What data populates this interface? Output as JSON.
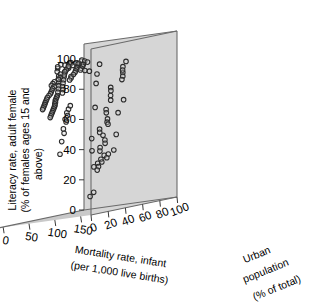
{
  "figure": {
    "type": "3d-scatter",
    "panel_color": "#d6d6d6",
    "floor_color": "#c9c9c9",
    "edge_color": "#6b6b6b",
    "point_stroke": "#2b2b2b",
    "point_fill": "#d6d6d6",
    "text_color": "#000000"
  },
  "axes": {
    "y": {
      "label_line1": "Literacy rate, adult female",
      "label_line2": "(% of females ages 15 and",
      "label_line3": "above)",
      "ticks": [
        "0",
        "20",
        "40",
        "60",
        "80",
        "100"
      ],
      "range": [
        0,
        110
      ]
    },
    "x": {
      "label_line1": "Mortality rate, infant",
      "label_line2": "(per 1,000 live births)",
      "ticks": [
        "0",
        "50",
        "100",
        "150"
      ],
      "range": [
        -10,
        170
      ]
    },
    "z": {
      "label_line1": "Urban",
      "label_line2": "population",
      "label_line3": "(% of total)",
      "ticks": [
        "100",
        "80",
        "60",
        "40",
        "20",
        "0"
      ],
      "range": [
        0,
        100
      ]
    }
  },
  "chart_data": {
    "type": "scatter",
    "title": "",
    "xlabel": "Mortality rate, infant (per 1,000 live births)",
    "ylabel": "Literacy rate, adult female (% of females ages 15 and above)",
    "zlabel": "Urban population (% of total)",
    "xlim": [
      -10,
      170
    ],
    "ylim": [
      0,
      110
    ],
    "zlim": [
      0,
      100
    ],
    "grid": false,
    "legend": "none",
    "n_points": 138,
    "points": [
      [
        6,
        99,
        73
      ],
      [
        8,
        99,
        67
      ],
      [
        10,
        100,
        61
      ],
      [
        12,
        100,
        70
      ],
      [
        5,
        99,
        75
      ],
      [
        14,
        98,
        55
      ],
      [
        9,
        99,
        58
      ],
      [
        16,
        97,
        66
      ],
      [
        11,
        100,
        72
      ],
      [
        18,
        96,
        52
      ],
      [
        20,
        95,
        60
      ],
      [
        22,
        97,
        63
      ],
      [
        13,
        98,
        68
      ],
      [
        24,
        94,
        57
      ],
      [
        26,
        93,
        49
      ],
      [
        15,
        99,
        77
      ],
      [
        28,
        92,
        54
      ],
      [
        30,
        91,
        46
      ],
      [
        17,
        98,
        71
      ],
      [
        32,
        90,
        51
      ],
      [
        19,
        96,
        62
      ],
      [
        34,
        89,
        44
      ],
      [
        21,
        95,
        59
      ],
      [
        36,
        88,
        48
      ],
      [
        23,
        94,
        53
      ],
      [
        38,
        87,
        42
      ],
      [
        25,
        93,
        56
      ],
      [
        40,
        86,
        45
      ],
      [
        27,
        92,
        50
      ],
      [
        42,
        85,
        39
      ],
      [
        29,
        91,
        47
      ],
      [
        44,
        84,
        43
      ],
      [
        31,
        90,
        41
      ],
      [
        46,
        83,
        36
      ],
      [
        33,
        89,
        38
      ],
      [
        48,
        82,
        40
      ],
      [
        35,
        88,
        35
      ],
      [
        50,
        81,
        33
      ],
      [
        37,
        87,
        37
      ],
      [
        52,
        80,
        31
      ],
      [
        39,
        86,
        34
      ],
      [
        54,
        79,
        29
      ],
      [
        41,
        85,
        32
      ],
      [
        56,
        78,
        27
      ],
      [
        43,
        84,
        30
      ],
      [
        58,
        77,
        26
      ],
      [
        45,
        83,
        28
      ],
      [
        60,
        76,
        24
      ],
      [
        47,
        82,
        25
      ],
      [
        62,
        75,
        23
      ],
      [
        49,
        81,
        22
      ],
      [
        64,
        74,
        21
      ],
      [
        51,
        80,
        20
      ],
      [
        66,
        73,
        19
      ],
      [
        53,
        79,
        18
      ],
      [
        68,
        72,
        17
      ],
      [
        55,
        78,
        16
      ],
      [
        70,
        71,
        15
      ],
      [
        57,
        77,
        14
      ],
      [
        72,
        70,
        13
      ],
      [
        59,
        76,
        12
      ],
      [
        74,
        69,
        11
      ],
      [
        61,
        75,
        10
      ],
      [
        76,
        68,
        9
      ],
      [
        63,
        74,
        8
      ],
      [
        7,
        99,
        80
      ],
      [
        9,
        98,
        82
      ],
      [
        11,
        97,
        85
      ],
      [
        6,
        100,
        88
      ],
      [
        13,
        96,
        78
      ],
      [
        8,
        99,
        90
      ],
      [
        15,
        95,
        76
      ],
      [
        10,
        98,
        92
      ],
      [
        17,
        94,
        74
      ],
      [
        12,
        97,
        86
      ],
      [
        19,
        93,
        72
      ],
      [
        14,
        96,
        84
      ],
      [
        21,
        92,
        69
      ],
      [
        16,
        95,
        81
      ],
      [
        23,
        91,
        65
      ],
      [
        18,
        94,
        79
      ],
      [
        25,
        90,
        64
      ],
      [
        20,
        93,
        83
      ],
      [
        27,
        89,
        61
      ],
      [
        22,
        92,
        87
      ],
      [
        35,
        70,
        55
      ],
      [
        40,
        68,
        50
      ],
      [
        45,
        64,
        45
      ],
      [
        30,
        72,
        60
      ],
      [
        50,
        58,
        40
      ],
      [
        55,
        50,
        35
      ],
      [
        60,
        42,
        30
      ],
      [
        38,
        66,
        52
      ],
      [
        42,
        62,
        48
      ],
      [
        48,
        55,
        42
      ],
      [
        85,
        88,
        88
      ],
      [
        92,
        92,
        84
      ],
      [
        98,
        90,
        80
      ],
      [
        105,
        86,
        76
      ],
      [
        110,
        84,
        72
      ],
      [
        88,
        95,
        90
      ],
      [
        95,
        80,
        68
      ],
      [
        102,
        78,
        64
      ],
      [
        108,
        75,
        60
      ],
      [
        115,
        72,
        56
      ],
      [
        90,
        70,
        86
      ],
      [
        96,
        66,
        62
      ],
      [
        103,
        64,
        58
      ],
      [
        112,
        60,
        54
      ],
      [
        118,
        58,
        50
      ],
      [
        86,
        62,
        82
      ],
      [
        93,
        56,
        66
      ],
      [
        100,
        54,
        52
      ],
      [
        107,
        52,
        48
      ],
      [
        120,
        50,
        44
      ],
      [
        89,
        48,
        78
      ],
      [
        97,
        46,
        60
      ],
      [
        104,
        44,
        56
      ],
      [
        111,
        42,
        46
      ],
      [
        124,
        40,
        38
      ],
      [
        91,
        38,
        74
      ],
      [
        99,
        36,
        58
      ],
      [
        106,
        34,
        50
      ],
      [
        113,
        32,
        42
      ],
      [
        128,
        30,
        34
      ],
      [
        87,
        36,
        70
      ],
      [
        94,
        34,
        64
      ],
      [
        101,
        32,
        54
      ],
      [
        109,
        30,
        40
      ],
      [
        132,
        28,
        30
      ],
      [
        140,
        98,
        28
      ],
      [
        145,
        92,
        22
      ],
      [
        150,
        86,
        18
      ],
      [
        138,
        70,
        24
      ],
      [
        148,
        50,
        14
      ],
      [
        142,
        14,
        20
      ],
      [
        155,
        12,
        8
      ],
      [
        152,
        42,
        12
      ]
    ]
  }
}
